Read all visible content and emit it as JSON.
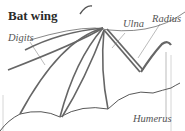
{
  "title": "Bat wing",
  "labels": {
    "digits": "Digits",
    "ulna": "Ulna",
    "radius": "Radius",
    "humerus": "Humerus"
  },
  "colors": {
    "bone": "#666666",
    "membrane": "#444444",
    "label": "#555555"
  }
}
